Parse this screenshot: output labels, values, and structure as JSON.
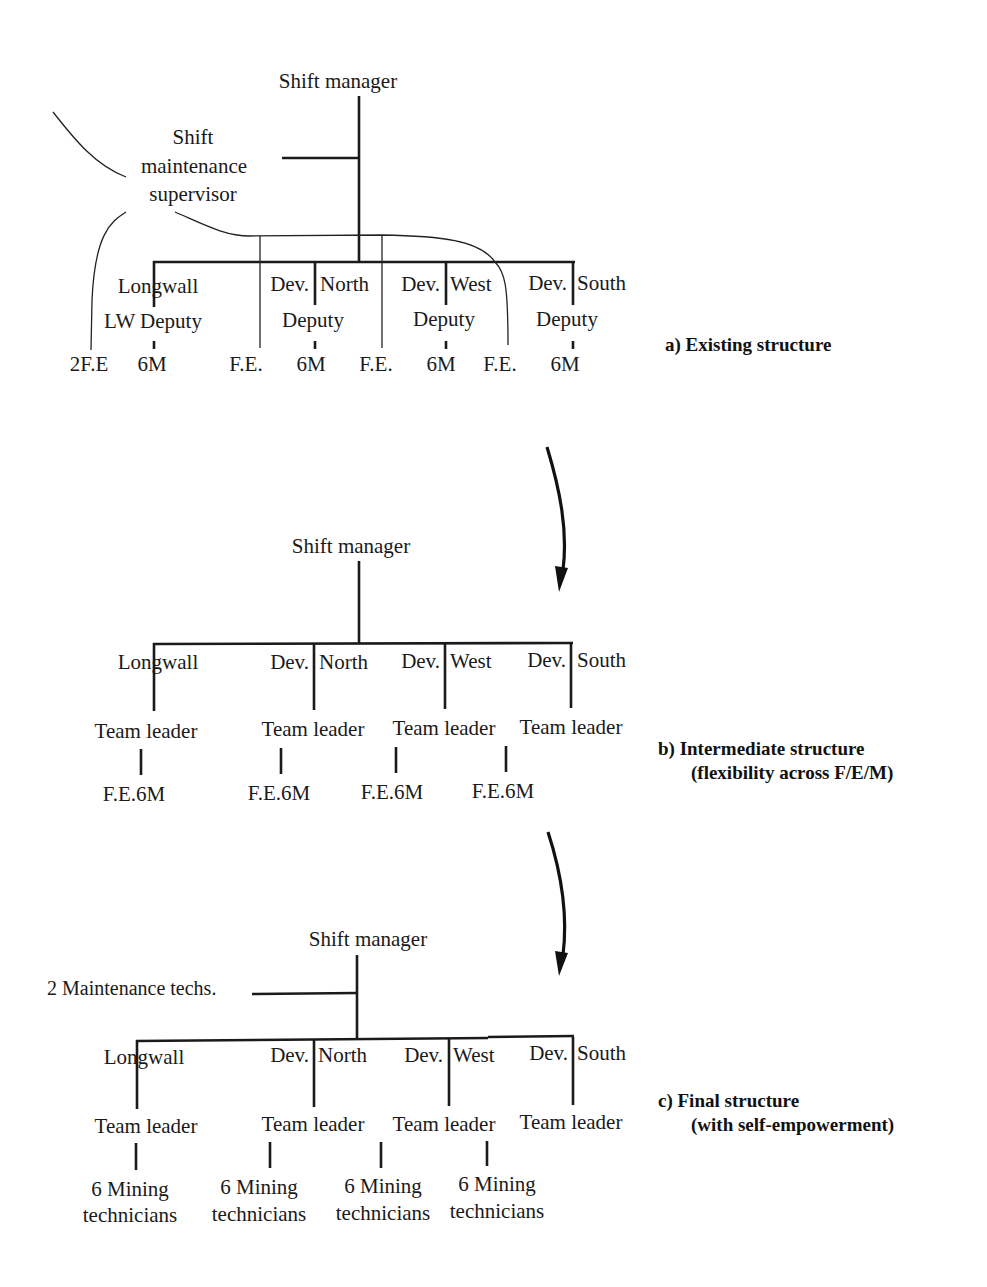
{
  "diagram": {
    "type": "organizational-structure-evolution",
    "colors": {
      "line": "#1a1a1a",
      "text": "#1a1a1a",
      "background": "#ffffff"
    },
    "section_a": {
      "caption": "a)  Existing structure",
      "top": "Shift manager",
      "supervisor": [
        "Shift",
        "maintenance",
        "supervisor"
      ],
      "units": [
        {
          "left": "Longwall",
          "right": "",
          "deputy": "LW Deputy",
          "crew": "6M",
          "fe": "2F.E"
        },
        {
          "left": "Dev.",
          "right": "North",
          "deputy": "Deputy",
          "crew": "6M",
          "fe": "F.E."
        },
        {
          "left": "Dev.",
          "right": "West",
          "deputy": "Deputy",
          "crew": "6M",
          "fe": "F.E."
        },
        {
          "left": "Dev.",
          "right": "South",
          "deputy": "Deputy",
          "crew": "6M",
          "fe": "F.E."
        }
      ]
    },
    "section_b": {
      "caption_line1": "b)  Intermediate structure",
      "caption_line2": "(flexibility across F/E/M)",
      "top": "Shift manager",
      "units": [
        {
          "left": "Longwall",
          "right": "",
          "leader": "Team leader",
          "crew": "F.E.6M"
        },
        {
          "left": "Dev.",
          "right": "North",
          "leader": "Team leader",
          "crew": "F.E.6M"
        },
        {
          "left": "Dev.",
          "right": "West",
          "leader": "Team leader",
          "crew": "F.E.6M"
        },
        {
          "left": "Dev.",
          "right": "South",
          "leader": "Team leader",
          "crew": "F.E.6M"
        }
      ]
    },
    "section_c": {
      "caption_line1": "c)  Final structure",
      "caption_line2": "(with self-empowerment)",
      "top": "Shift manager",
      "side": "2 Maintenance techs.",
      "units": [
        {
          "left": "Longwall",
          "right": "",
          "leader": "Team leader",
          "crew1": "6 Mining",
          "crew2": "technicians"
        },
        {
          "left": "Dev.",
          "right": "North",
          "leader": "Team leader",
          "crew1": "6 Mining",
          "crew2": "technicians"
        },
        {
          "left": "Dev.",
          "right": "West",
          "leader": "Team leader",
          "crew1": "6 Mining",
          "crew2": "technicians"
        },
        {
          "left": "Dev.",
          "right": "South",
          "leader": "Team leader",
          "crew1": "6 Mining",
          "crew2": "technicians"
        }
      ]
    },
    "arrows": [
      "a-to-b transition arrow",
      "b-to-c transition arrow"
    ]
  }
}
